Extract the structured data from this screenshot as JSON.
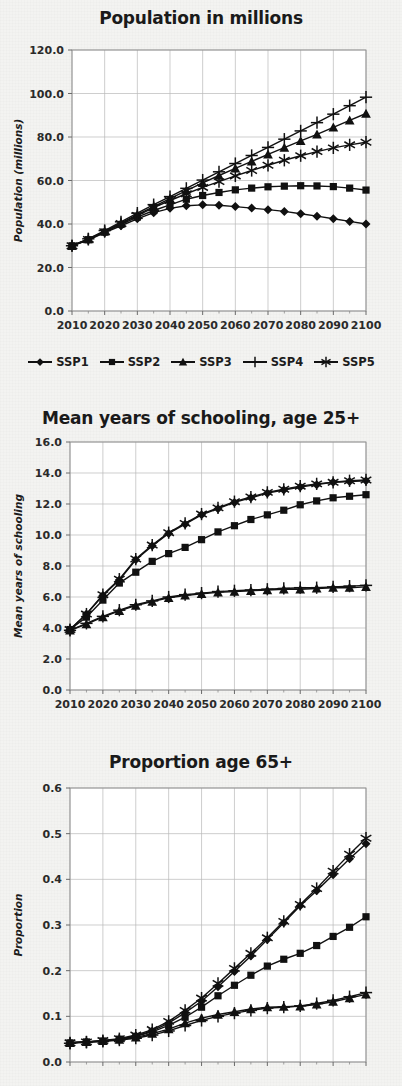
{
  "figure": {
    "background_color": "#f3f3f1",
    "ink_color": "#111111",
    "grid_color": "#b9b9b9"
  },
  "legend": {
    "items": [
      {
        "label": "SSP1",
        "marker": "diamond"
      },
      {
        "label": "SSP2",
        "marker": "square"
      },
      {
        "label": "SSP3",
        "marker": "triangle"
      },
      {
        "label": "SSP4",
        "marker": "plus"
      },
      {
        "label": "SSP5",
        "marker": "asterisk"
      }
    ]
  },
  "panels": {
    "population": {
      "title": "Population in millions",
      "ylabel": "Population (millions)",
      "yticks": [
        "0.0",
        "20.0",
        "40.0",
        "60.0",
        "80.0",
        "100.0",
        "120.0"
      ],
      "xticks": [
        "2010",
        "2020",
        "2030",
        "2040",
        "2050",
        "2060",
        "2070",
        "2080",
        "2090",
        "2100"
      ]
    },
    "schooling": {
      "title": "Mean years of schooling, age 25+",
      "ylabel": "Mean years of schooling",
      "yticks": [
        "0.0",
        "2.0",
        "4.0",
        "6.0",
        "8.0",
        "10.0",
        "12.0",
        "14.0",
        "16.0"
      ],
      "xticks": [
        "2010",
        "2020",
        "2030",
        "2040",
        "2050",
        "2060",
        "2070",
        "2080",
        "2090",
        "2100"
      ]
    },
    "proportion": {
      "title": "Proportion age 65+",
      "ylabel": "Proportion",
      "yticks": [
        "0.0",
        "0.1",
        "0.2",
        "0.3",
        "0.4",
        "0.5",
        "0.6"
      ],
      "xticks": []
    }
  },
  "chart_data": [
    {
      "type": "line",
      "id": "population",
      "title": "Population in millions",
      "xlabel": "",
      "ylabel": "Population (millions)",
      "xlim": [
        2010,
        2100
      ],
      "ylim": [
        0,
        120
      ],
      "ytick_step": 20,
      "xtick_step": 10,
      "grid": true,
      "legend_position": "below",
      "x": [
        2010,
        2015,
        2020,
        2025,
        2030,
        2035,
        2040,
        2045,
        2050,
        2055,
        2060,
        2065,
        2070,
        2075,
        2080,
        2085,
        2090,
        2095,
        2100
      ],
      "series": [
        {
          "name": "SSP1",
          "marker": "diamond",
          "values": [
            30.0,
            32.6,
            36.0,
            39.2,
            42.4,
            45.2,
            47.2,
            48.4,
            48.8,
            48.6,
            48.0,
            47.3,
            46.6,
            45.8,
            44.7,
            43.6,
            42.4,
            41.2,
            40.0
          ]
        },
        {
          "name": "SSP2",
          "marker": "square",
          "values": [
            30.0,
            32.8,
            36.3,
            39.8,
            43.2,
            46.2,
            48.8,
            51.4,
            53.1,
            54.5,
            55.7,
            56.5,
            57.1,
            57.4,
            57.6,
            57.5,
            57.2,
            56.5,
            55.6
          ]
        },
        {
          "name": "SSP3",
          "marker": "triangle",
          "values": [
            30.0,
            33.0,
            36.6,
            40.4,
            44.3,
            48.0,
            51.7,
            55.4,
            58.9,
            62.3,
            65.6,
            68.8,
            72.0,
            75.1,
            78.2,
            81.2,
            84.4,
            87.6,
            90.8
          ]
        },
        {
          "name": "SSP4",
          "marker": "plus",
          "values": [
            30.0,
            33.2,
            37.0,
            41.0,
            45.0,
            48.9,
            52.6,
            56.4,
            60.2,
            64.0,
            67.8,
            71.5,
            75.2,
            79.0,
            82.8,
            86.6,
            90.5,
            94.4,
            98.3
          ]
        },
        {
          "name": "SSP5",
          "marker": "asterisk",
          "values": [
            30.0,
            32.9,
            36.5,
            40.2,
            43.9,
            47.5,
            50.8,
            53.9,
            56.8,
            59.5,
            62.1,
            64.6,
            67.0,
            69.3,
            71.4,
            73.3,
            75.0,
            76.4,
            77.6
          ]
        }
      ]
    },
    {
      "type": "line",
      "id": "schooling",
      "title": "Mean years of schooling, age 25+",
      "xlabel": "",
      "ylabel": "Mean years of schooling",
      "xlim": [
        2010,
        2100
      ],
      "ylim": [
        0,
        16
      ],
      "ytick_step": 2,
      "xtick_step": 10,
      "grid": true,
      "legend_position": "none",
      "x": [
        2010,
        2015,
        2020,
        2025,
        2030,
        2035,
        2040,
        2045,
        2050,
        2055,
        2060,
        2065,
        2070,
        2075,
        2080,
        2085,
        2090,
        2095,
        2100
      ],
      "series": [
        {
          "name": "SSP1",
          "marker": "diamond",
          "values": [
            3.9,
            4.9,
            6.1,
            7.1,
            8.4,
            9.3,
            10.1,
            10.7,
            11.3,
            11.7,
            12.1,
            12.4,
            12.7,
            12.9,
            13.1,
            13.25,
            13.4,
            13.45,
            13.5
          ]
        },
        {
          "name": "SSP2",
          "marker": "square",
          "values": [
            3.9,
            4.7,
            5.8,
            6.9,
            7.6,
            8.3,
            8.8,
            9.2,
            9.7,
            10.2,
            10.6,
            11.0,
            11.3,
            11.6,
            11.95,
            12.2,
            12.4,
            12.5,
            12.6
          ]
        },
        {
          "name": "SSP3",
          "marker": "triangle",
          "values": [
            3.85,
            4.25,
            4.7,
            5.1,
            5.45,
            5.7,
            5.95,
            6.1,
            6.2,
            6.3,
            6.35,
            6.4,
            6.45,
            6.5,
            6.5,
            6.55,
            6.6,
            6.6,
            6.65
          ]
        },
        {
          "name": "SSP4",
          "marker": "plus",
          "values": [
            3.85,
            4.3,
            4.75,
            5.15,
            5.5,
            5.75,
            6.0,
            6.15,
            6.25,
            6.35,
            6.4,
            6.45,
            6.5,
            6.55,
            6.6,
            6.6,
            6.65,
            6.7,
            6.75
          ]
        },
        {
          "name": "SSP5",
          "marker": "asterisk",
          "values": [
            3.9,
            4.9,
            6.15,
            7.15,
            8.45,
            9.35,
            10.15,
            10.75,
            11.35,
            11.75,
            12.15,
            12.45,
            12.75,
            12.95,
            13.15,
            13.3,
            13.4,
            13.5,
            13.55
          ]
        }
      ]
    },
    {
      "type": "line",
      "id": "proportion",
      "title": "Proportion age 65+",
      "xlabel": "",
      "ylabel": "Proportion",
      "xlim": [
        2010,
        2100
      ],
      "ylim": [
        0,
        0.6
      ],
      "ytick_step": 0.1,
      "xtick_step": 10,
      "grid": true,
      "legend_position": "none",
      "x": [
        2010,
        2015,
        2020,
        2025,
        2030,
        2035,
        2040,
        2045,
        2050,
        2055,
        2060,
        2065,
        2070,
        2075,
        2080,
        2085,
        2090,
        2095,
        2100
      ],
      "series": [
        {
          "name": "SSP1",
          "marker": "diamond",
          "values": [
            0.042,
            0.044,
            0.046,
            0.05,
            0.057,
            0.068,
            0.085,
            0.108,
            0.133,
            0.165,
            0.198,
            0.232,
            0.268,
            0.305,
            0.342,
            0.375,
            0.41,
            0.445,
            0.478
          ]
        },
        {
          "name": "SSP2",
          "marker": "square",
          "values": [
            0.042,
            0.044,
            0.046,
            0.05,
            0.056,
            0.066,
            0.08,
            0.098,
            0.12,
            0.145,
            0.168,
            0.19,
            0.21,
            0.225,
            0.238,
            0.255,
            0.275,
            0.295,
            0.318
          ]
        },
        {
          "name": "SSP3",
          "marker": "triangle",
          "values": [
            0.042,
            0.044,
            0.046,
            0.049,
            0.054,
            0.062,
            0.072,
            0.085,
            0.096,
            0.104,
            0.11,
            0.116,
            0.12,
            0.121,
            0.122,
            0.126,
            0.132,
            0.14,
            0.148
          ]
        },
        {
          "name": "SSP4",
          "marker": "plus",
          "values": [
            0.041,
            0.043,
            0.045,
            0.048,
            0.052,
            0.059,
            0.068,
            0.08,
            0.091,
            0.1,
            0.107,
            0.113,
            0.118,
            0.12,
            0.123,
            0.128,
            0.135,
            0.143,
            0.152
          ]
        },
        {
          "name": "SSP5",
          "marker": "asterisk",
          "values": [
            0.042,
            0.044,
            0.047,
            0.051,
            0.059,
            0.071,
            0.089,
            0.113,
            0.14,
            0.172,
            0.205,
            0.238,
            0.272,
            0.308,
            0.345,
            0.38,
            0.418,
            0.455,
            0.49
          ]
        }
      ]
    }
  ]
}
